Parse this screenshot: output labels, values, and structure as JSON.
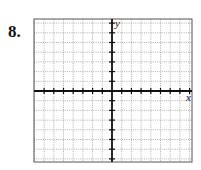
{
  "problem": {
    "number_label": "8."
  },
  "graph": {
    "x_axis_label": "x",
    "y_axis_label": "y",
    "grid": {
      "columns": 16,
      "rows": 16,
      "style": "dotted"
    },
    "box": {
      "left": 34,
      "top": 19,
      "right": 192,
      "bottom": 162
    },
    "origin": {
      "x": 112,
      "y": 91
    },
    "colors": {
      "axis": "#111111",
      "grid": "#9a9a9a",
      "border": "#555555"
    }
  }
}
